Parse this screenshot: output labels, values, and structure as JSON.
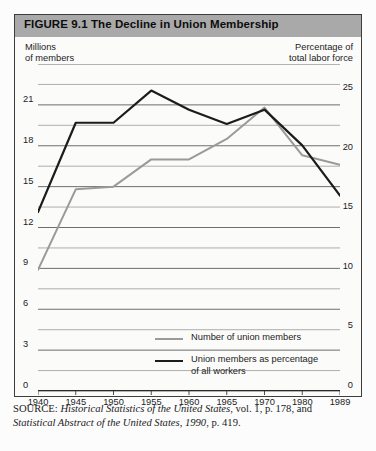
{
  "figure": {
    "title": "FIGURE 9.1  The Decline in Union Membership",
    "left_axis_caption": "Millions\nof members",
    "left_axis_caption_line1": "Millions",
    "left_axis_caption_line2": "of members",
    "right_axis_caption_line1": "Percentage of",
    "right_axis_caption_line2": "total labor force",
    "title_band_color": "#a9a9a9",
    "frame_color": "#3d3d3d"
  },
  "legend": {
    "position": "inside-bottom-center",
    "entries": [
      {
        "label": "Number of union members",
        "color": "#9a9a9a",
        "width": 2.2
      },
      {
        "label": "Union members as percentage of all workers",
        "label_line1": "Union members as percentage",
        "label_line2": "of all workers",
        "color": "#1c1c1c",
        "width": 2.4
      }
    ]
  },
  "source": {
    "prefix": "SOURCE:",
    "italic1": "Historical Statistics of the United States",
    "plain1": ", vol. 1, p. 178, and",
    "italic2": "Statistical Abstract of the United States, 1990",
    "plain2": ", p. 419."
  },
  "chart_data": {
    "type": "line",
    "title": "FIGURE 9.1  The Decline in Union Membership",
    "xlabel": "",
    "ylabel": "Millions of members",
    "y2label": "Percentage of total labor force",
    "grid": true,
    "x": [
      1940,
      1945,
      1950,
      1955,
      1960,
      1965,
      1970,
      1980,
      1989
    ],
    "xticklabels": [
      "1940",
      "1945",
      "1950",
      "1955",
      "1960",
      "1965",
      "1970",
      "1980",
      "1989"
    ],
    "xlim": [
      1940,
      1989
    ],
    "ylim": [
      0,
      24
    ],
    "yticks": [
      0,
      3,
      6,
      9,
      12,
      15,
      18,
      21
    ],
    "yticklabels": [
      "0",
      "3",
      "6",
      "9",
      "12",
      "15",
      "18",
      "21"
    ],
    "y2lim": [
      0,
      27.43
    ],
    "y2ticks": [
      0,
      5,
      10,
      15,
      20,
      25
    ],
    "y2ticklabels": [
      "0",
      "5",
      "10",
      "15",
      "20",
      "25"
    ],
    "minor_gridlines": true,
    "series": [
      {
        "name": "Number of union members",
        "axis": "left",
        "units": "millions",
        "color": "#9a9a9a",
        "values": [
          8.9,
          14.8,
          15.0,
          17.0,
          17.0,
          18.5,
          20.8,
          17.3,
          16.6
        ]
      },
      {
        "name": "Union members as percentage of all workers",
        "axis": "right",
        "units": "percent",
        "color": "#1c1c1c",
        "values": [
          15.0,
          22.5,
          22.5,
          25.2,
          23.6,
          22.4,
          23.6,
          20.6,
          16.4
        ]
      }
    ]
  }
}
